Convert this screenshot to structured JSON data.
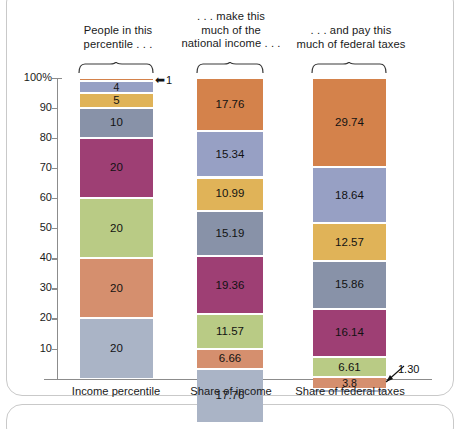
{
  "chart_data": {
    "type": "bar",
    "title": "",
    "subtitle": "",
    "xlabel": "",
    "ylabel": "",
    "ylim": [
      0,
      100
    ],
    "grid": false,
    "legend_position": "none",
    "stacked": true,
    "yaxis": {
      "unit": "%",
      "ticks": [
        "100%",
        "90",
        "80",
        "70",
        "60",
        "50",
        "40",
        "30",
        "20",
        "10"
      ],
      "tick_values": [
        100,
        90,
        80,
        70,
        60,
        50,
        40,
        30,
        20,
        10
      ]
    },
    "categories": [
      "Income percentile",
      "Share of income",
      "Share of federal taxes"
    ],
    "column_headers": [
      "People in this\npercentile . . .",
      ". . . make this\nmuch of the\nnational income . . .",
      ". . . and pay this\nmuch of federal taxes"
    ],
    "group_colors": {
      "top1": "#d4824b",
      "next4": "#97a0c4",
      "next5": "#e0b358",
      "next10": "#8892a8",
      "quintile4": "#9e3f74",
      "quintile3": "#b9cb85",
      "quintile2": "#d58f6e",
      "quintile1": "#aab4c6"
    },
    "series": [
      {
        "name": "Income percentile",
        "segments": [
          {
            "label": "1",
            "value": 1,
            "color": "#d4824b",
            "label_shown": false
          },
          {
            "label": "4",
            "value": 4,
            "color": "#97a0c4",
            "label_shown": true
          },
          {
            "label": "5",
            "value": 5,
            "color": "#e0b358",
            "label_shown": true
          },
          {
            "label": "10",
            "value": 10,
            "color": "#8892a8",
            "label_shown": true
          },
          {
            "label": "20",
            "value": 20,
            "color": "#9e3f74",
            "label_shown": true
          },
          {
            "label": "20",
            "value": 20,
            "color": "#b9cb85",
            "label_shown": true
          },
          {
            "label": "20",
            "value": 20,
            "color": "#d58f6e",
            "label_shown": true
          },
          {
            "label": "20",
            "value": 20,
            "color": "#aab4c6",
            "label_shown": true
          }
        ]
      },
      {
        "name": "Share of income",
        "segments": [
          {
            "label": "17.76",
            "value": 17.76,
            "color": "#d4824b",
            "label_shown": true
          },
          {
            "label": "15.34",
            "value": 15.34,
            "color": "#97a0c4",
            "label_shown": true
          },
          {
            "label": "10.99",
            "value": 10.99,
            "color": "#e0b358",
            "label_shown": true
          },
          {
            "label": "15.19",
            "value": 15.19,
            "color": "#8892a8",
            "label_shown": true
          },
          {
            "label": "19.36",
            "value": 19.36,
            "color": "#9e3f74",
            "label_shown": true
          },
          {
            "label": "11.57",
            "value": 11.57,
            "color": "#b9cb85",
            "label_shown": true
          },
          {
            "label": "6.66",
            "value": 6.66,
            "color": "#d58f6e",
            "label_shown": true
          },
          {
            "label": "17.76",
            "value": 17.76,
            "color": "#aab4c6",
            "label_shown": true
          }
        ]
      },
      {
        "name": "Share of federal taxes",
        "segments": [
          {
            "label": "29.74",
            "value": 29.74,
            "color": "#d4824b",
            "label_shown": true
          },
          {
            "label": "18.64",
            "value": 18.64,
            "color": "#97a0c4",
            "label_shown": true
          },
          {
            "label": "12.57",
            "value": 12.57,
            "color": "#e0b358",
            "label_shown": true
          },
          {
            "label": "15.86",
            "value": 15.86,
            "color": "#8892a8",
            "label_shown": true
          },
          {
            "label": "16.14",
            "value": 16.14,
            "color": "#9e3f74",
            "label_shown": true
          },
          {
            "label": "6.61",
            "value": 6.61,
            "color": "#b9cb85",
            "label_shown": true
          },
          {
            "label": "3.8",
            "value": 3.8,
            "color": "#d58f6e",
            "label_shown": true
          },
          {
            "label": "1.30",
            "value": 1.3,
            "color": "#aab4c6",
            "label_shown": false
          }
        ]
      }
    ],
    "annotations": [
      {
        "name": "top-percentile-callout",
        "text": "1",
        "arrow": "←",
        "target": "Income percentile top segment"
      },
      {
        "name": "bottom-tax-share-callout",
        "text": "1.30",
        "target": "Share of federal taxes bottom segment"
      }
    ]
  }
}
